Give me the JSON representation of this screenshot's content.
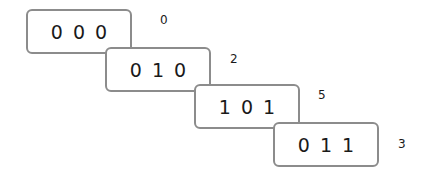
{
  "diagram": {
    "rows": [
      {
        "bits": [
          "0",
          "0",
          "0"
        ],
        "value": "0"
      },
      {
        "bits": [
          "0",
          "1",
          "0"
        ],
        "value": "2"
      },
      {
        "bits": [
          "1",
          "0",
          "1"
        ],
        "value": "5"
      },
      {
        "bits": [
          "0",
          "1",
          "1"
        ],
        "value": "3"
      }
    ],
    "colors": {
      "border": "#8c8c8c",
      "text": "#1a1a1a"
    }
  }
}
